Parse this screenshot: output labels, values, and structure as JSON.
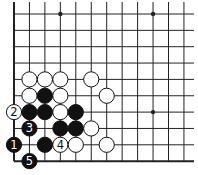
{
  "diagram": {
    "type": "go-board-corner",
    "corner": "bottom-left",
    "columns": 12,
    "rows": 10,
    "edges": {
      "left": true,
      "bottom": true,
      "top": false,
      "right": false
    },
    "star_points": [
      {
        "col": 3,
        "row": 0
      },
      {
        "col": 9,
        "row": 0
      },
      {
        "col": 9,
        "row": 6
      }
    ],
    "stones": [
      {
        "color": "white",
        "col": 1,
        "row": 4,
        "label": ""
      },
      {
        "color": "white",
        "col": 2,
        "row": 4,
        "label": ""
      },
      {
        "color": "white",
        "col": 3,
        "row": 4,
        "label": ""
      },
      {
        "color": "white",
        "col": 5,
        "row": 4,
        "label": ""
      },
      {
        "color": "white",
        "col": 1,
        "row": 5,
        "label": ""
      },
      {
        "color": "black",
        "col": 2,
        "row": 5,
        "label": ""
      },
      {
        "color": "white",
        "col": 3,
        "row": 5,
        "label": ""
      },
      {
        "color": "white",
        "col": 6,
        "row": 5,
        "label": ""
      },
      {
        "color": "white",
        "col": 0,
        "row": 6,
        "label": "2"
      },
      {
        "color": "black",
        "col": 1,
        "row": 6,
        "label": ""
      },
      {
        "color": "black",
        "col": 2,
        "row": 6,
        "label": ""
      },
      {
        "color": "white",
        "col": 3,
        "row": 6,
        "label": ""
      },
      {
        "color": "black",
        "col": 4,
        "row": 6,
        "label": ""
      },
      {
        "color": "black",
        "col": 1,
        "row": 7,
        "label": "3"
      },
      {
        "color": "black",
        "col": 3,
        "row": 7,
        "label": ""
      },
      {
        "color": "black",
        "col": 4,
        "row": 7,
        "label": ""
      },
      {
        "color": "white",
        "col": 5,
        "row": 7,
        "label": ""
      },
      {
        "color": "black",
        "col": 0,
        "row": 8,
        "label": "1"
      },
      {
        "color": "black",
        "col": 2,
        "row": 8,
        "label": ""
      },
      {
        "color": "white",
        "col": 3,
        "row": 8,
        "label": "4"
      },
      {
        "color": "white",
        "col": 4,
        "row": 8,
        "label": ""
      },
      {
        "color": "white",
        "col": 6,
        "row": 8,
        "label": ""
      },
      {
        "color": "black",
        "col": 1,
        "row": 9,
        "label": "5"
      }
    ],
    "colors": {
      "line": "#222222",
      "black_stone": "#111111",
      "white_stone": "#ffffff",
      "background": "#ffffff"
    }
  }
}
